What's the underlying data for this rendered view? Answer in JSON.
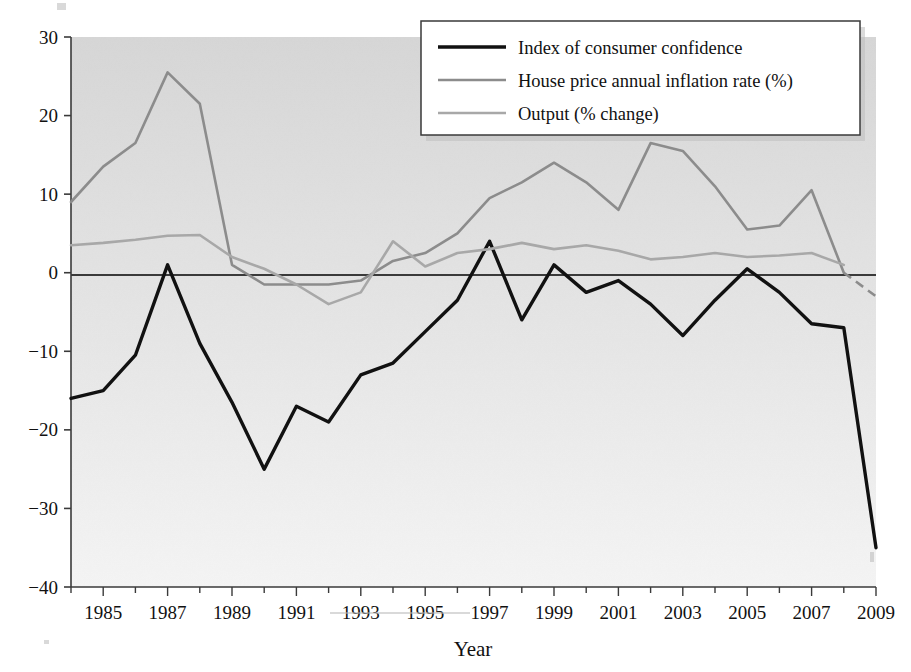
{
  "figure": {
    "caption_fragment": "",
    "background_color": "#ffffff"
  },
  "axes": {
    "x_title": "Year",
    "y_title": "",
    "x_ticks": [
      1984,
      1985,
      1986,
      1987,
      1988,
      1989,
      1990,
      1991,
      1992,
      1993,
      1994,
      1995,
      1996,
      1997,
      1998,
      1999,
      2000,
      2001,
      2002,
      2003,
      2004,
      2005,
      2006,
      2007,
      2008,
      2009
    ],
    "x_tick_labels": [
      "",
      "1985",
      "",
      "1987",
      "",
      "1989",
      "",
      "1991",
      "",
      "1993",
      "",
      "1995",
      "",
      "1997",
      "",
      "1999",
      "",
      "2001",
      "",
      "2003",
      "",
      "2005",
      "",
      "2007",
      "",
      "2009"
    ],
    "y_ticks": [
      -40,
      -30,
      -20,
      -10,
      0,
      10,
      20,
      30
    ],
    "y_tick_labels": [
      "-40",
      "-30",
      "-20",
      "-10",
      "0",
      "10",
      "20",
      "30"
    ],
    "xlim": [
      1984,
      2009
    ],
    "ylim": [
      -40,
      30
    ],
    "zero_line": 0,
    "grid": false
  },
  "legend": {
    "position": "top-right",
    "entries": [
      {
        "label": "Index of consumer confidence",
        "color": "#111111",
        "width": 3.4
      },
      {
        "label": "House price annual inflation rate (%)",
        "color": "#8c8c8c",
        "width": 2.6
      },
      {
        "label": "Output (% change)",
        "color": "#a8a8a8",
        "width": 2.6
      }
    ]
  },
  "colors": {
    "plot_bg_top": "#d6d6d6",
    "plot_bg_bottom": "#f2f2f2",
    "axis": "#3a3a3a",
    "confidence": "#111111",
    "house_price": "#8c8c8c",
    "output": "#a8a8a8"
  },
  "chart_data": {
    "type": "line",
    "title": "",
    "xlabel": "Year",
    "ylabel": "",
    "xlim": [
      1984,
      2009
    ],
    "ylim": [
      -40,
      30
    ],
    "grid": false,
    "x": [
      1984,
      1985,
      1986,
      1987,
      1988,
      1989,
      1990,
      1991,
      1992,
      1993,
      1994,
      1995,
      1996,
      1997,
      1998,
      1999,
      2000,
      2001,
      2002,
      2003,
      2004,
      2005,
      2006,
      2007,
      2008,
      2009
    ],
    "series": [
      {
        "name": "Index of consumer confidence",
        "color": "#111111",
        "values": [
          -16.0,
          -15.0,
          -10.5,
          1.0,
          -9.0,
          -16.5,
          -25.0,
          -17.0,
          -19.0,
          -13.0,
          -11.5,
          -7.5,
          -3.5,
          4.0,
          -6.0,
          1.0,
          -2.5,
          -1.0,
          -4.0,
          -8.0,
          -3.5,
          0.5,
          -2.5,
          -6.5,
          -7.0,
          -35.0
        ]
      },
      {
        "name": "House price annual inflation rate (%)",
        "color": "#8c8c8c",
        "values": [
          9.0,
          13.5,
          16.5,
          25.5,
          21.5,
          1.0,
          -1.5,
          -1.5,
          -1.5,
          -1.0,
          1.5,
          2.5,
          5.0,
          9.5,
          11.5,
          14.0,
          11.5,
          8.0,
          16.5,
          15.5,
          11.0,
          5.5,
          6.0,
          10.5,
          0.0,
          null
        ],
        "dashed_tail": {
          "x": [
            2008,
            2009
          ],
          "values": [
            0.0,
            -3.0
          ],
          "style": "dashed"
        }
      },
      {
        "name": "Output (% change)",
        "color": "#a8a8a8",
        "values": [
          3.5,
          3.8,
          4.2,
          4.7,
          4.8,
          2.0,
          0.5,
          -1.5,
          -4.0,
          -2.5,
          4.0,
          0.8,
          2.5,
          3.0,
          3.8,
          3.0,
          3.5,
          2.8,
          1.7,
          2.0,
          2.5,
          2.0,
          2.2,
          2.5,
          1.0,
          null
        ]
      }
    ]
  }
}
